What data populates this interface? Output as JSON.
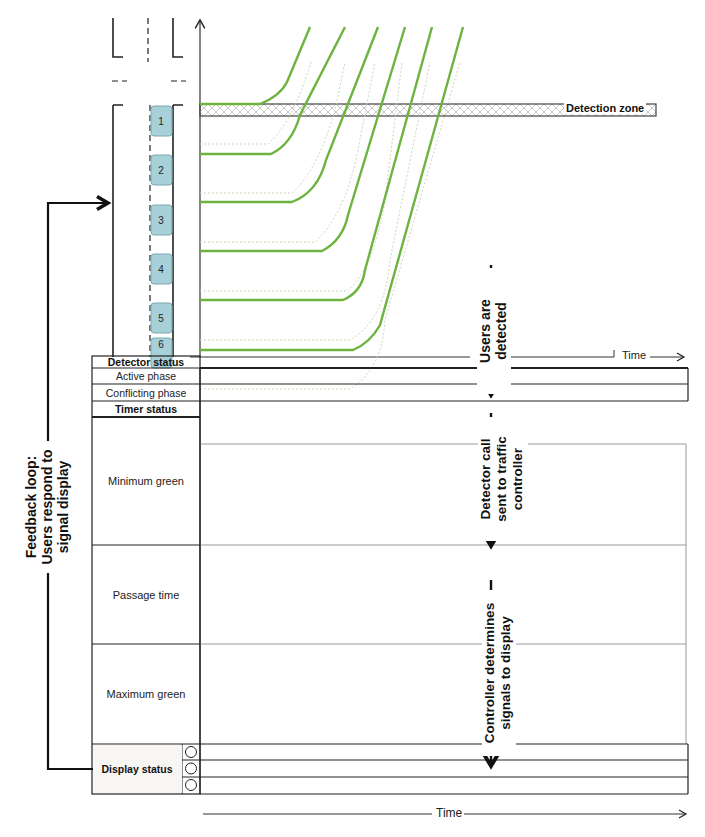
{
  "diagram": {
    "type": "actuated signal control timing diagram",
    "top_panel": {
      "y_axis": "distance (arrow up)",
      "x_axis_label": "Time",
      "detection_zone_label": "Detection zone",
      "vehicles": [
        "1",
        "2",
        "3",
        "4",
        "5",
        "6"
      ],
      "trajectory_color": "#6db33f",
      "trajectory_ghost_color": "#c8d8b0"
    },
    "flow_labels": {
      "users_detected": [
        "Users are",
        "detected"
      ],
      "detector_call": [
        "Detector call",
        "sent to traffic",
        "controller"
      ],
      "controller_determines": [
        "Controller determines",
        "signals to display"
      ],
      "feedback_loop": [
        "Feedback loop:",
        "Users respond to",
        "signal display"
      ]
    },
    "table": {
      "rows": [
        {
          "id": "detector-status",
          "label": "Detector status",
          "bold": true
        },
        {
          "id": "active-phase",
          "label": "Active phase",
          "bold": false
        },
        {
          "id": "conflicting-phase",
          "label": "Conflicting phase",
          "bold": false
        },
        {
          "id": "timer-status",
          "label": "Timer status",
          "bold": true
        },
        {
          "id": "minimum-green",
          "label": "Minimum green",
          "bold": false
        },
        {
          "id": "passage-time",
          "label": "Passage time",
          "bold": false
        },
        {
          "id": "maximum-green",
          "label": "Maximum green",
          "bold": false
        },
        {
          "id": "display-status",
          "label": "Display status",
          "bold": true
        }
      ],
      "display_signal_count": 3,
      "bottom_axis_label": "Time"
    }
  }
}
